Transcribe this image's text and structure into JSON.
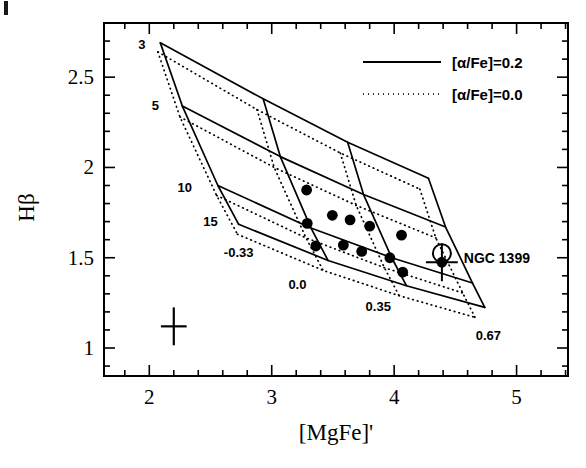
{
  "chart_data": {
    "type": "scatter",
    "title": "",
    "xlabel": "[MgFe]'",
    "ylabel": "Hβ",
    "xlim": [
      1.63,
      5.42
    ],
    "ylim": [
      0.845,
      2.8
    ],
    "xticks": [
      2,
      3,
      4,
      5
    ],
    "xticklabels": [
      "2",
      "3",
      "4",
      "5"
    ],
    "yticks": [
      1,
      1.5,
      2,
      2.5
    ],
    "yticklabels": [
      "1",
      "1.5",
      "2",
      "2.5"
    ],
    "minor_tick_step_x": 0.2,
    "minor_tick_step_y": 0.1,
    "grid": false,
    "legend_position": "top-right",
    "legend": [
      {
        "label": "[α/Fe]=0.2",
        "style": "solid"
      },
      {
        "label": "[α/Fe]=0.0",
        "style": "dotted"
      }
    ],
    "age_label_text": [
      "3",
      "5",
      "10",
      "15"
    ],
    "age_label_values": [
      3,
      5,
      10,
      15
    ],
    "age_label_points": [
      [
        1.94,
        2.655
      ],
      [
        2.05,
        2.32
      ],
      [
        2.29,
        1.865
      ],
      [
        2.5,
        1.675
      ]
    ],
    "metallicity_label_text": [
      "-0.33",
      "0.0",
      "0.35",
      "0.67"
    ],
    "metallicity_label_values": [
      -0.33,
      0.0,
      0.35,
      0.67
    ],
    "metallicity_label_points": [
      [
        2.73,
        1.505
      ],
      [
        3.21,
        1.325
      ],
      [
        3.87,
        1.205
      ],
      [
        4.77,
        1.045
      ]
    ],
    "model_grid_solid": {
      "name": "[α/Fe]=0.2",
      "ages": [
        3,
        5,
        10,
        15
      ],
      "metallicities": [
        -0.33,
        0.0,
        0.35,
        0.67
      ],
      "points": [
        [
          [
            2.09,
            2.69
          ],
          [
            2.93,
            2.38
          ],
          [
            3.62,
            2.14
          ],
          [
            4.28,
            1.94
          ]
        ],
        [
          [
            2.27,
            2.34
          ],
          [
            3.07,
            2.06
          ],
          [
            3.75,
            1.85
          ],
          [
            4.42,
            1.67
          ]
        ],
        [
          [
            2.56,
            1.9
          ],
          [
            3.32,
            1.665
          ],
          [
            3.98,
            1.5
          ],
          [
            4.64,
            1.36
          ]
        ],
        [
          [
            2.73,
            1.685
          ],
          [
            3.46,
            1.485
          ],
          [
            4.1,
            1.345
          ],
          [
            4.74,
            1.225
          ]
        ]
      ]
    },
    "model_grid_dotted": {
      "name": "[α/Fe]=0.0",
      "ages": [
        3,
        5,
        10,
        15
      ],
      "metallicities": [
        -0.33,
        0.0,
        0.35,
        0.67
      ],
      "points": [
        [
          [
            2.07,
            2.64
          ],
          [
            2.88,
            2.32
          ],
          [
            3.56,
            2.08
          ],
          [
            4.21,
            1.88
          ]
        ],
        [
          [
            2.25,
            2.28
          ],
          [
            3.02,
            2.0
          ],
          [
            3.69,
            1.79
          ],
          [
            4.34,
            1.61
          ]
        ],
        [
          [
            2.55,
            1.845
          ],
          [
            3.28,
            1.61
          ],
          [
            3.92,
            1.445
          ],
          [
            4.56,
            1.305
          ]
        ],
        [
          [
            2.72,
            1.63
          ],
          [
            3.42,
            1.43
          ],
          [
            4.04,
            1.29
          ],
          [
            4.66,
            1.17
          ]
        ]
      ]
    },
    "galaxies": {
      "marker": "filled-circle",
      "points": [
        [
          3.285,
          1.875
        ],
        [
          3.495,
          1.735
        ],
        [
          3.29,
          1.69
        ],
        [
          3.64,
          1.71
        ],
        [
          3.8,
          1.675
        ],
        [
          3.36,
          1.565
        ],
        [
          3.585,
          1.57
        ],
        [
          3.735,
          1.535
        ],
        [
          4.06,
          1.625
        ],
        [
          3.965,
          1.5
        ],
        [
          4.07,
          1.42
        ],
        [
          4.39,
          1.475
        ]
      ]
    },
    "highlighted_object": {
      "label": "NGC 1399",
      "x": 4.39,
      "y": 1.475,
      "marker": "open-circle-with-error-bars",
      "xerr": 0.13,
      "yerr": 0.105,
      "label_point": [
        4.52,
        1.5
      ]
    },
    "typical_error": {
      "x": 2.2,
      "y": 1.12,
      "xerr": 0.105,
      "yerr": 0.105
    }
  },
  "colors": {
    "foreground": "#000000",
    "background": "#ffffff"
  }
}
